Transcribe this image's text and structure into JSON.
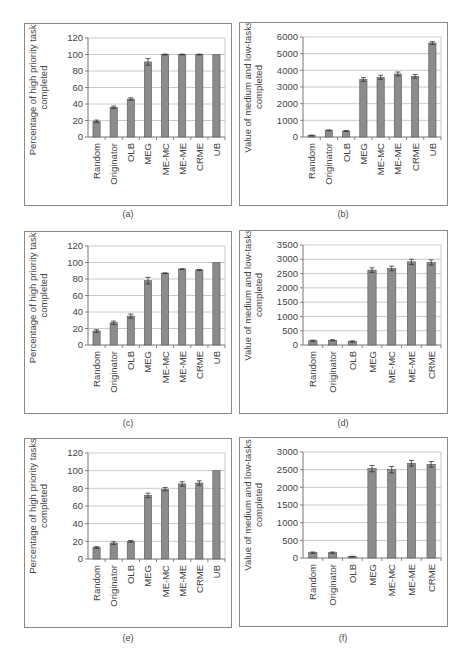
{
  "figure": {
    "bar_color": "#8c8c8c",
    "bar_edge_color": "#555555",
    "grid_color": "#bdbdbd",
    "axis_color": "#666666",
    "panels": [
      {
        "id": "a",
        "caption": "(a)"
      },
      {
        "id": "b",
        "caption": "(b)"
      },
      {
        "id": "c",
        "caption": "(c)"
      },
      {
        "id": "d",
        "caption": "(d)"
      },
      {
        "id": "e",
        "caption": "(e)"
      },
      {
        "id": "f",
        "caption": "(f)"
      }
    ]
  },
  "chart_data": [
    {
      "panel": "a",
      "type": "bar",
      "title": "",
      "xlabel": "",
      "ylabel": "Percentage of high priority tasks completed",
      "ylabel_lines": [
        "Percentage of high priority tasks",
        "completed"
      ],
      "categories": [
        "Random",
        "Originator",
        "OLB",
        "MEG",
        "ME-MC",
        "ME-ME",
        "CRME",
        "UB"
      ],
      "values": [
        19,
        36,
        46,
        91,
        100,
        100,
        100,
        100
      ],
      "errors": [
        1.5,
        1.5,
        1.5,
        4,
        0.5,
        0.5,
        0.5,
        0
      ],
      "ylim": [
        0,
        120
      ],
      "yticks": [
        0,
        20,
        40,
        60,
        80,
        100,
        120
      ],
      "grid": true,
      "legend": null
    },
    {
      "panel": "b",
      "type": "bar",
      "title": "",
      "xlabel": "",
      "ylabel": "Value of medium and low-tasks completed",
      "ylabel_lines": [
        "Value of medium and low-tasks",
        "completed"
      ],
      "categories": [
        "Random",
        "Originator",
        "OLB",
        "MEG",
        "ME-MC",
        "ME-ME",
        "CRME",
        "UB"
      ],
      "values": [
        90,
        400,
        360,
        3450,
        3580,
        3780,
        3640,
        5640
      ],
      "errors": [
        25,
        25,
        25,
        110,
        120,
        120,
        110,
        80
      ],
      "ylim": [
        0,
        6000
      ],
      "yticks": [
        0,
        1000,
        2000,
        3000,
        4000,
        5000,
        6000
      ],
      "grid": true,
      "legend": null
    },
    {
      "panel": "c",
      "type": "bar",
      "title": "",
      "xlabel": "",
      "ylabel": "Percentage of high priority tasks completed",
      "ylabel_lines": [
        "Percentage of high priority tasks",
        "completed"
      ],
      "categories": [
        "Random",
        "Originator",
        "OLB",
        "MEG",
        "ME-MC",
        "ME-ME",
        "CRME",
        "UB"
      ],
      "values": [
        17,
        27,
        35,
        78,
        87,
        92,
        91,
        100
      ],
      "errors": [
        1.5,
        2,
        2.5,
        4,
        0.5,
        0.5,
        0.5,
        0
      ],
      "ylim": [
        0,
        120
      ],
      "yticks": [
        0,
        20,
        40,
        60,
        80,
        100,
        120
      ],
      "grid": true,
      "legend": null
    },
    {
      "panel": "d",
      "type": "bar",
      "title": "",
      "xlabel": "",
      "ylabel": "Value of medium and low-tasks completed",
      "ylabel_lines": [
        "Value of medium and low-tasks",
        "completed"
      ],
      "categories": [
        "Random",
        "Originator",
        "OLB",
        "MEG",
        "ME-MC",
        "ME-ME",
        "CRME"
      ],
      "values": [
        150,
        165,
        125,
        2620,
        2680,
        2910,
        2890
      ],
      "errors": [
        20,
        20,
        20,
        80,
        80,
        90,
        90
      ],
      "ylim": [
        0,
        3500
      ],
      "yticks": [
        0,
        500,
        1000,
        1500,
        2000,
        2500,
        3000,
        3500
      ],
      "grid": true,
      "legend": null
    },
    {
      "panel": "e",
      "type": "bar",
      "title": "",
      "xlabel": "",
      "ylabel": "Percentage of high priority tasks completed",
      "ylabel_lines": [
        "Percentage of high priority tasks",
        "completed"
      ],
      "categories": [
        "Random",
        "Originator",
        "OLB",
        "MEG",
        "ME-MC",
        "ME-ME",
        "CRME",
        "UB"
      ],
      "values": [
        13,
        18,
        20,
        72,
        79,
        85,
        86,
        100
      ],
      "errors": [
        1,
        1.5,
        1,
        2.5,
        2,
        2.5,
        2.5,
        0
      ],
      "ylim": [
        0,
        120
      ],
      "yticks": [
        0,
        20,
        40,
        60,
        80,
        100,
        120
      ],
      "grid": true,
      "legend": null
    },
    {
      "panel": "f",
      "type": "bar",
      "title": "",
      "xlabel": "",
      "ylabel": "Value of medium and low-tasks completed",
      "ylabel_lines": [
        "Value of medium and low-tasks",
        "completed"
      ],
      "categories": [
        "Random",
        "Originator",
        "OLB",
        "MEG",
        "ME-MC",
        "ME-ME",
        "CRME"
      ],
      "values": [
        150,
        150,
        40,
        2530,
        2500,
        2680,
        2650
      ],
      "errors": [
        20,
        20,
        10,
        90,
        90,
        80,
        80
      ],
      "ylim": [
        0,
        3000
      ],
      "yticks": [
        0,
        500,
        1000,
        1500,
        2000,
        2500,
        3000
      ],
      "grid": true,
      "legend": null
    }
  ]
}
